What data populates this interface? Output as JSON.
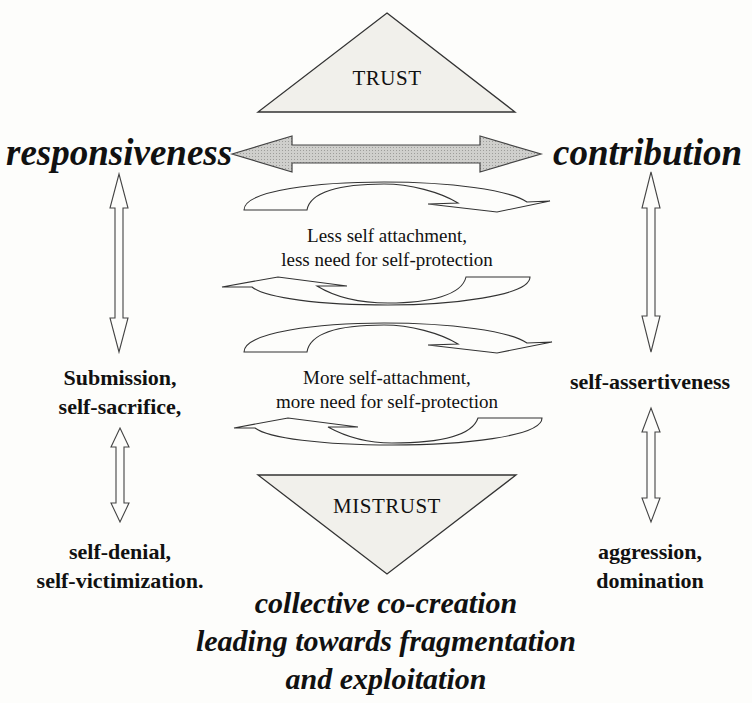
{
  "diagram": {
    "top_triangle": {
      "label": "TRUST",
      "fill": "#f1f0eb"
    },
    "bottom_triangle": {
      "label": "MISTRUST",
      "fill": "#f1f0eb"
    },
    "left_pole": "responsiveness",
    "right_pole": "contribution",
    "horizontal_arrow": {
      "fill": "#c9c9c6",
      "direction": "bidirectional"
    },
    "upper_cycle_text": {
      "line1": "Less self attachment,",
      "line2": "less need for self-protection"
    },
    "lower_cycle_text": {
      "line1": "More self-attachment,",
      "line2": "more need for self-protection"
    },
    "left_column": {
      "middle": {
        "line1": "Submission,",
        "line2": "self-sacrifice,"
      },
      "bottom": {
        "line1": "self-denial,",
        "line2": "self-victimization."
      }
    },
    "right_column": {
      "middle": "self-assertiveness",
      "bottom": {
        "line1": "aggression,",
        "line2": "domination"
      }
    },
    "footer": {
      "line1": "collective co-creation",
      "line2": "leading towards fragmentation",
      "line3": "and exploitation"
    }
  }
}
